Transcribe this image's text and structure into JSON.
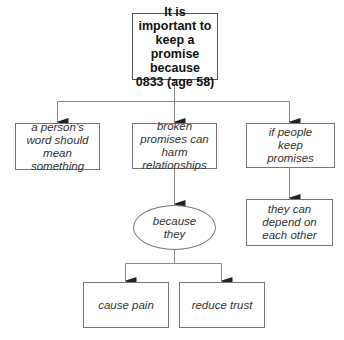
{
  "diagram": {
    "root": {
      "label": "It is important to keep a promise because 0833 (age 58)"
    },
    "level1": [
      {
        "label": "a person's word should mean something"
      },
      {
        "label": "broken promises can harm relationships"
      },
      {
        "label": "if people keep promises"
      }
    ],
    "connector": {
      "label": "because they"
    },
    "level3": [
      {
        "label": "cause pain"
      },
      {
        "label": "reduce trust"
      }
    ],
    "right_child": {
      "label": "they can depend on each other"
    },
    "colors": {
      "line": "#777777",
      "text": "#333333",
      "background": "#ffffff"
    }
  }
}
